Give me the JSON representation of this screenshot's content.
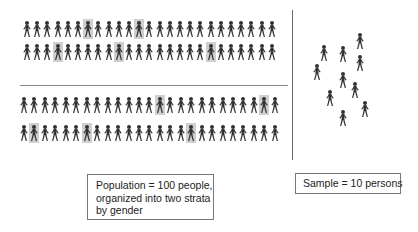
{
  "diagram": {
    "type": "stratified-sampling-illustration",
    "population": {
      "total": 100,
      "strata": [
        {
          "name": "stratum-1",
          "rows": [
            {
              "count": 25,
              "x0": 22,
              "dx": 10.2,
              "y": 19,
              "highlighted_indices": [
                6,
                11
              ]
            },
            {
              "count": 25,
              "x0": 22,
              "dx": 10.2,
              "y": 42,
              "highlighted_indices": [
                3,
                9,
                18
              ]
            }
          ]
        },
        {
          "name": "stratum-2",
          "rows": [
            {
              "count": 25,
              "x0": 19,
              "dx": 10.45,
              "y": 95,
              "highlighted_indices": [
                13,
                23
              ]
            },
            {
              "count": 25,
              "x0": 19,
              "dx": 10.45,
              "y": 123,
              "highlighted_indices": [
                1,
                6,
                16
              ]
            }
          ]
        }
      ]
    },
    "sample": {
      "count": 10,
      "positions": [
        [
          319,
          43
        ],
        [
          338,
          44
        ],
        [
          355,
          31
        ],
        [
          312,
          62
        ],
        [
          355,
          53
        ],
        [
          338,
          70
        ],
        [
          350,
          80
        ],
        [
          325,
          88
        ],
        [
          360,
          99
        ],
        [
          338,
          108
        ]
      ]
    },
    "colors": {
      "figure": "#333333",
      "highlight": "#cfcfcf",
      "divider": "#888888",
      "box_border": "#777777",
      "text": "#222222"
    },
    "labels": {
      "population_box": {
        "line1": "Population = 100 people,",
        "line2": "organized into two strata",
        "line3": "by gender"
      },
      "sample_box": {
        "line1": "Sample = 10 persons"
      }
    }
  }
}
